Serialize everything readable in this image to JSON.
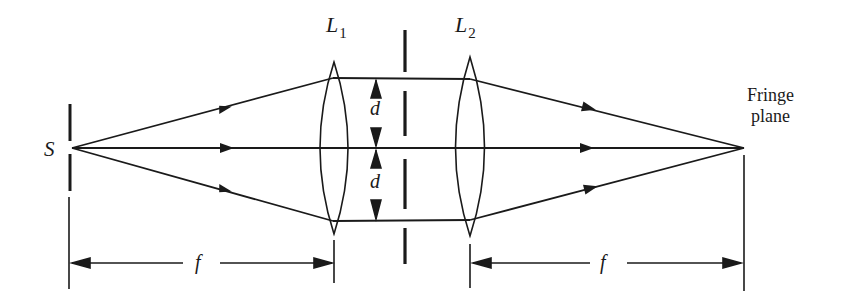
{
  "figure": {
    "type": "optical-ray-diagram",
    "colors": {
      "ink": "#1a1a1a",
      "background": "#ffffff"
    }
  },
  "labels": {
    "source": "S",
    "lens1": {
      "main": "L",
      "sub": "1"
    },
    "lens2": {
      "main": "L",
      "sub": "2"
    },
    "separation_top": "d",
    "separation_bottom": "d",
    "focal_left": "f",
    "focal_right": "f",
    "fringe_plane_line1": "Fringe",
    "fringe_plane_line2": "plane"
  },
  "geometry": {
    "axis_y": 148,
    "source_x": 70,
    "lens1_x": 334,
    "double_slit_x": 405,
    "lens2_x": 470,
    "fringe_plane_x": 744,
    "ray_offset_top_y": 78,
    "ray_offset_bottom_y": 221
  }
}
